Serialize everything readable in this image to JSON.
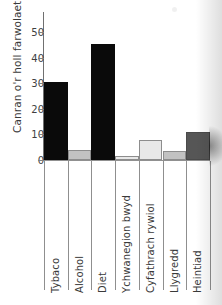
{
  "chart_data": {
    "type": "bar",
    "title": "",
    "subtitle": "",
    "xlabel": "",
    "ylabel": "Canran o'r holl farwolaethau",
    "ylim": [
      0,
      58
    ],
    "yticks": [
      0,
      10,
      20,
      30,
      40,
      50
    ],
    "ytick_labels": [
      "0",
      "10",
      "20",
      "30",
      "40",
      "50"
    ],
    "grid": false,
    "legend": "none",
    "categories": [
      "Tybaco",
      "Alcohol",
      "Diet",
      "Ychwanegion bwyd",
      "Cyfathrach rywiol",
      "Llygredd",
      "Heintiad"
    ],
    "values": [
      30.5,
      4.0,
      45.5,
      1.5,
      7.7,
      3.6,
      11.0
    ],
    "bar_colors": [
      "#0a0a0a",
      "#c2c2c2",
      "#0a0a0a",
      "#e8e8e8",
      "#e8e8e8",
      "#c2c2c2",
      "#565656"
    ],
    "bar_styles": [
      "dark",
      "mid",
      "dark",
      "light",
      "light",
      "mid",
      "darkgrey"
    ],
    "annotations": []
  },
  "colors": {
    "axis": "#808080",
    "text": "#3a3a3a",
    "background": "#ffffff"
  }
}
